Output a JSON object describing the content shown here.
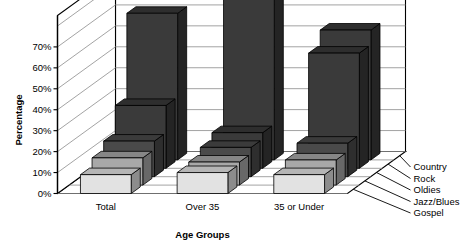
{
  "chart_data": {
    "type": "bar",
    "title": "",
    "subtitle": "",
    "xlabel": "Age Groups",
    "ylabel": "Percentage",
    "categories": [
      "Total",
      "Over 35",
      "35 or Under"
    ],
    "series": [
      {
        "name": "Country",
        "values": [
          70,
          80,
          62
        ],
        "color": "#3a3a3a"
      },
      {
        "name": "Rock",
        "values": [
          30,
          17,
          55
        ],
        "color": "#3a3a3a"
      },
      {
        "name": "Oldies",
        "values": [
          17,
          14,
          16
        ],
        "color": "#4a4a4a"
      },
      {
        "name": "Jazz/Blues",
        "values": [
          13,
          11,
          12
        ],
        "color": "#a8a8a8"
      },
      {
        "name": "Gospel",
        "values": [
          9,
          10,
          9
        ],
        "color": "#e2e2e2"
      }
    ],
    "ytick_labels": [
      "0%",
      "10%",
      "20%",
      "30%",
      "40%",
      "50%",
      "60%",
      "70%"
    ],
    "ytick_values": [
      0,
      10,
      20,
      30,
      40,
      50,
      60,
      70
    ],
    "ylim": [
      0,
      85
    ],
    "grid": true,
    "legend_position": "right",
    "legend_entries": [
      "Country",
      "Rock",
      "Oldies",
      "Jazz/Blues",
      "Gospel"
    ],
    "projection": "3d-isometric",
    "background_color": "#ffffff",
    "axis_color": "#000000",
    "gridline_color": "#8c8c8c"
  }
}
